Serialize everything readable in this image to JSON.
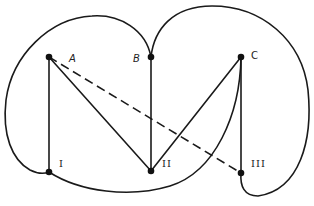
{
  "diagram": {
    "type": "graph",
    "colors": {
      "stroke": "#1a1a1a",
      "node": "#111111",
      "background": "#ffffff"
    },
    "nodes": [
      {
        "id": "A",
        "label": "A",
        "x": 49,
        "y": 57
      },
      {
        "id": "B",
        "label": "B",
        "x": 151,
        "y": 57
      },
      {
        "id": "C",
        "label": "C",
        "x": 241,
        "y": 57
      },
      {
        "id": "I",
        "label": "I",
        "x": 49,
        "y": 172
      },
      {
        "id": "II",
        "label": "II",
        "x": 151,
        "y": 171
      },
      {
        "id": "III",
        "label": "III",
        "x": 241,
        "y": 173
      }
    ],
    "edges": [
      {
        "from": "A",
        "to": "I",
        "style": "solid",
        "shape": "straight"
      },
      {
        "from": "A",
        "to": "II",
        "style": "solid",
        "shape": "straight"
      },
      {
        "from": "A",
        "to": "III",
        "style": "dashed",
        "shape": "straight"
      },
      {
        "from": "B",
        "to": "II",
        "style": "solid",
        "shape": "straight"
      },
      {
        "from": "B",
        "to": "I",
        "style": "solid",
        "shape": "curve-left-lobe"
      },
      {
        "from": "B",
        "to": "III",
        "style": "solid",
        "shape": "curve-right-lobe"
      },
      {
        "from": "C",
        "to": "II",
        "style": "solid",
        "shape": "straight"
      },
      {
        "from": "C",
        "to": "III",
        "style": "solid",
        "shape": "straight"
      },
      {
        "from": "C",
        "to": "I",
        "style": "solid",
        "shape": "curve-bottom"
      }
    ]
  }
}
